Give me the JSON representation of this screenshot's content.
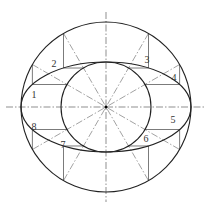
{
  "diagram": {
    "title": "",
    "center": {
      "x": 106,
      "y": 107
    },
    "outer_circle_radius": 85,
    "inner_circle_radius": 45,
    "ellipse": {
      "rx": 85,
      "ry": 45
    },
    "division_angles_deg": [
      30,
      60,
      120,
      150,
      210,
      240,
      300,
      330
    ],
    "point_labels": [
      {
        "text": "1",
        "x": 34,
        "y": 98
      },
      {
        "text": "2",
        "x": 54,
        "y": 67
      },
      {
        "text": "3",
        "x": 147,
        "y": 63
      },
      {
        "text": "4",
        "x": 174,
        "y": 81
      },
      {
        "text": "5",
        "x": 173,
        "y": 123
      },
      {
        "text": "6",
        "x": 146,
        "y": 142
      },
      {
        "text": "7",
        "x": 63,
        "y": 148
      },
      {
        "text": "8",
        "x": 34,
        "y": 130
      }
    ],
    "colors": {
      "stroke": "#222222",
      "centerline": "#444444"
    }
  }
}
